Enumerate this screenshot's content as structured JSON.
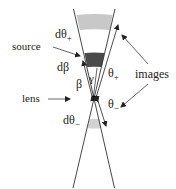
{
  "diagram": {
    "type": "gravitational-lensing-geometry",
    "colors": {
      "background": "#ffffff",
      "line": "#333333",
      "band_light": "#c8c8c8",
      "band_source": "#4a4a4a",
      "band_lower": "#d2d2d2",
      "lens_dot": "#000000"
    },
    "labels": {
      "d_theta_plus": "dθ",
      "d_theta_plus_sub": "+",
      "source": "source",
      "d_beta": "dβ",
      "beta": "β",
      "gamma": "γ",
      "theta_plus": "θ",
      "theta_plus_sub": "+",
      "images": "images",
      "lens": "lens",
      "theta_minus": "θ",
      "theta_minus_sub": "−",
      "d_theta_minus": "dθ",
      "d_theta_minus_sub": "−"
    }
  }
}
